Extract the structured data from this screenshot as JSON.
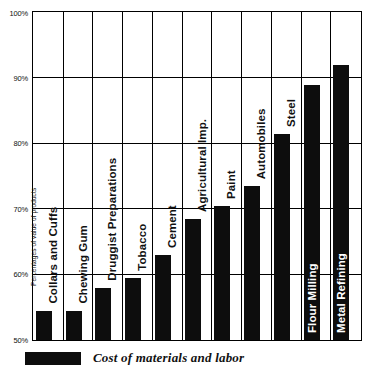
{
  "chart_data": {
    "type": "bar",
    "title": "",
    "subtitle": "",
    "xlabel": "",
    "ylabel": "Percentages of value of products",
    "ylim": [
      50,
      100
    ],
    "yticks": [
      50,
      60,
      70,
      80,
      90,
      100
    ],
    "ytick_labels": [
      "50%",
      "60%",
      "70%",
      "80%",
      "90%",
      "100%"
    ],
    "grid": true,
    "grid_axis": "both",
    "legend_position": "bottom-left",
    "legend": [
      {
        "label": "Cost of materials and labor",
        "color": "#0d0d0d"
      }
    ],
    "categories": [
      "Collars and Cuffs",
      "Chewing Gum",
      "Druggist Preparations",
      "Tobacco",
      "Cement",
      "Agricultural Imp.",
      "Paint",
      "Automobiles",
      "Steel",
      "Flour Milling",
      "Metal Refining"
    ],
    "values": [
      54.5,
      54.5,
      58.0,
      59.5,
      63.0,
      68.5,
      70.5,
      73.5,
      81.5,
      89.0,
      92.0
    ],
    "series": [
      {
        "name": "Cost of materials and labor",
        "color": "#0d0d0d",
        "values": [
          54.5,
          54.5,
          58.0,
          59.5,
          63.0,
          68.5,
          70.5,
          73.5,
          81.5,
          89.0,
          92.0
        ]
      }
    ],
    "label_on_bar": [
      false,
      false,
      false,
      false,
      false,
      false,
      false,
      false,
      false,
      true,
      true
    ]
  }
}
